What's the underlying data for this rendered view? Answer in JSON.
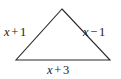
{
  "figure": {
    "kind": "triangle-with-side-labels",
    "background_color": "#ffffff",
    "stroke_color": "#2b2b2b",
    "text_color": "#1a1a1a",
    "vertices": {
      "apex": [
        62,
        9
      ],
      "bottom_left": [
        16,
        60
      ],
      "bottom_right": [
        110,
        60
      ]
    },
    "labels": {
      "left_side": {
        "variable": "x",
        "operator": "+",
        "constant": "1",
        "full": "x + 1"
      },
      "right_side": {
        "variable": "x",
        "operator": "−",
        "constant": "1",
        "full": "x − 1"
      },
      "base": {
        "variable": "x",
        "operator": "+",
        "constant": "3",
        "full": "x + 3"
      }
    }
  }
}
